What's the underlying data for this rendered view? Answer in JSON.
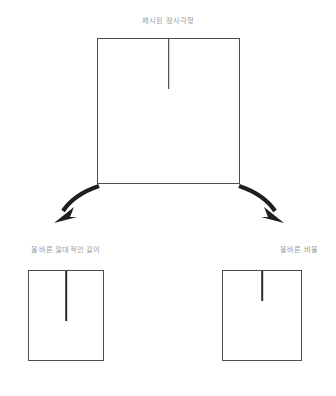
{
  "diagram": {
    "title": "제시된 정사각형",
    "source_square": {
      "name": "presented-square",
      "line_orientation": "vertical",
      "line_anchor": "top-center",
      "line_length_px": 50,
      "square_size_px": [
        143,
        146
      ],
      "line_ratio_of_height": 0.34
    },
    "branches": [
      {
        "label": "올바른 절대적인 길이",
        "interpretation": "absolute-length",
        "square_size_px": [
          76,
          91
        ],
        "line_length_px": 50,
        "line_ratio_of_height": 0.55,
        "arrow_direction": "down-left"
      },
      {
        "label": "올바른 비율",
        "interpretation": "relative-ratio",
        "square_size_px": [
          80,
          91
        ],
        "line_length_px": 30,
        "line_ratio_of_height": 0.33,
        "arrow_direction": "down-right"
      }
    ],
    "colors": {
      "caption_text": "#9a9a9a",
      "square_border": "#4d4d4d",
      "tick_line": "#2b2b2b",
      "arrow": "#1f1f1f",
      "background": "#ffffff"
    }
  }
}
